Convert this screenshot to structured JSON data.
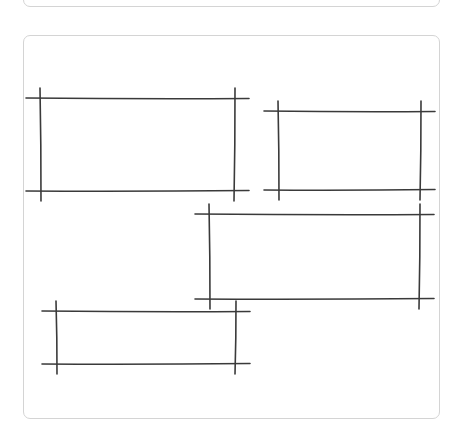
{
  "colors": {
    "stroke": "#3a3a3a",
    "card_border": "#d4d4d4",
    "background": "#ffffff"
  },
  "rectangles": [
    {
      "name": "sketch-rect-1",
      "left": 40,
      "top": 98,
      "right": 235,
      "bottom": 191
    },
    {
      "name": "sketch-rect-2",
      "left": 278,
      "top": 111,
      "right": 421,
      "bottom": 190
    },
    {
      "name": "sketch-rect-3",
      "left": 209,
      "top": 214,
      "right": 420,
      "bottom": 299
    },
    {
      "name": "sketch-rect-4",
      "left": 56,
      "top": 311,
      "right": 236,
      "bottom": 364
    }
  ]
}
